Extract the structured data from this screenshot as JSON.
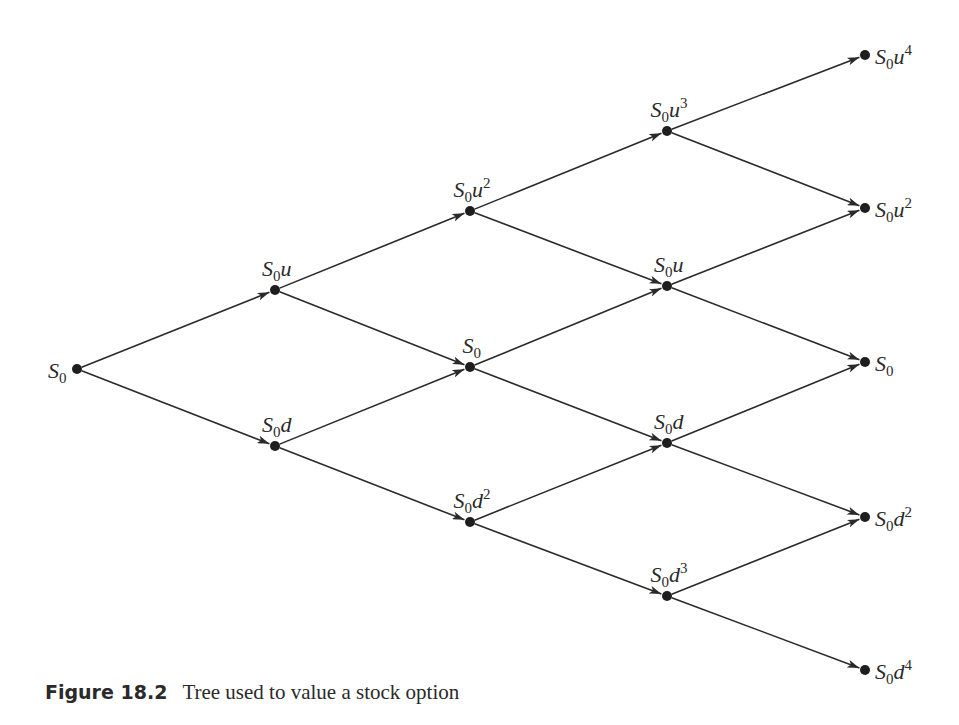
{
  "figure": {
    "number": "Figure 18.2",
    "caption": "Tree used to value a stock option"
  },
  "style": {
    "line_color": "#2a2a2a",
    "node_color": "#1e1e1e",
    "background": "#ffffff"
  },
  "tree": {
    "steps": 4,
    "nodes": [
      {
        "id": "n0_0",
        "step": 0,
        "x": 77,
        "y": 369,
        "base": "S",
        "sub": "0",
        "var": "",
        "exp": "",
        "label_pos": "left"
      },
      {
        "id": "n1_0",
        "step": 1,
        "x": 275,
        "y": 290,
        "base": "S",
        "sub": "0",
        "var": "u",
        "exp": "",
        "label_pos": "above"
      },
      {
        "id": "n1_1",
        "step": 1,
        "x": 275,
        "y": 446,
        "base": "S",
        "sub": "0",
        "var": "d",
        "exp": "",
        "label_pos": "above"
      },
      {
        "id": "n2_0",
        "step": 2,
        "x": 470,
        "y": 211,
        "base": "S",
        "sub": "0",
        "var": "u",
        "exp": "2",
        "label_pos": "above"
      },
      {
        "id": "n2_1",
        "step": 2,
        "x": 470,
        "y": 367,
        "base": "S",
        "sub": "0",
        "var": "",
        "exp": "",
        "label_pos": "above"
      },
      {
        "id": "n2_2",
        "step": 2,
        "x": 470,
        "y": 522,
        "base": "S",
        "sub": "0",
        "var": "d",
        "exp": "2",
        "label_pos": "above"
      },
      {
        "id": "n3_0",
        "step": 3,
        "x": 667,
        "y": 131,
        "base": "S",
        "sub": "0",
        "var": "u",
        "exp": "3",
        "label_pos": "above"
      },
      {
        "id": "n3_1",
        "step": 3,
        "x": 667,
        "y": 286,
        "base": "S",
        "sub": "0",
        "var": "u",
        "exp": "",
        "label_pos": "above"
      },
      {
        "id": "n3_2",
        "step": 3,
        "x": 667,
        "y": 443,
        "base": "S",
        "sub": "0",
        "var": "d",
        "exp": "",
        "label_pos": "above"
      },
      {
        "id": "n3_3",
        "step": 3,
        "x": 667,
        "y": 596,
        "base": "S",
        "sub": "0",
        "var": "d",
        "exp": "3",
        "label_pos": "above"
      },
      {
        "id": "n4_0",
        "step": 4,
        "x": 865,
        "y": 55,
        "base": "S",
        "sub": "0",
        "var": "u",
        "exp": "4",
        "label_pos": "right"
      },
      {
        "id": "n4_1",
        "step": 4,
        "x": 865,
        "y": 208,
        "base": "S",
        "sub": "0",
        "var": "u",
        "exp": "2",
        "label_pos": "right"
      },
      {
        "id": "n4_2",
        "step": 4,
        "x": 865,
        "y": 362,
        "base": "S",
        "sub": "0",
        "var": "",
        "exp": "",
        "label_pos": "right"
      },
      {
        "id": "n4_3",
        "step": 4,
        "x": 865,
        "y": 517,
        "base": "S",
        "sub": "0",
        "var": "d",
        "exp": "2",
        "label_pos": "right"
      },
      {
        "id": "n4_4",
        "step": 4,
        "x": 865,
        "y": 670,
        "base": "S",
        "sub": "0",
        "var": "d",
        "exp": "4",
        "label_pos": "right"
      }
    ],
    "edges": [
      [
        "n0_0",
        "n1_0"
      ],
      [
        "n0_0",
        "n1_1"
      ],
      [
        "n1_0",
        "n2_0"
      ],
      [
        "n1_0",
        "n2_1"
      ],
      [
        "n1_1",
        "n2_1"
      ],
      [
        "n1_1",
        "n2_2"
      ],
      [
        "n2_0",
        "n3_0"
      ],
      [
        "n2_0",
        "n3_1"
      ],
      [
        "n2_1",
        "n3_1"
      ],
      [
        "n2_1",
        "n3_2"
      ],
      [
        "n2_2",
        "n3_2"
      ],
      [
        "n2_2",
        "n3_3"
      ],
      [
        "n3_0",
        "n4_0"
      ],
      [
        "n3_0",
        "n4_1"
      ],
      [
        "n3_1",
        "n4_1"
      ],
      [
        "n3_1",
        "n4_2"
      ],
      [
        "n3_2",
        "n4_2"
      ],
      [
        "n3_2",
        "n4_3"
      ],
      [
        "n3_3",
        "n4_3"
      ],
      [
        "n3_3",
        "n4_4"
      ]
    ]
  }
}
